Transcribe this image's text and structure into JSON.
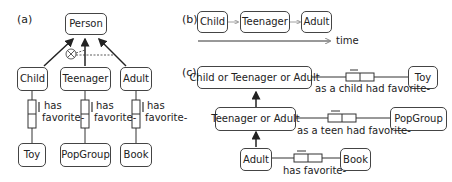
{
  "panels": {
    "a": {
      "label": "(a)",
      "supertype": "Person",
      "subtypes": [
        "Child",
        "Teenager",
        "Adult"
      ],
      "fact_label_line1": "has",
      "fact_label_line2": "favorite-",
      "targets": [
        "Toy",
        "PopGroup",
        "Book"
      ],
      "constraint": "exclusive-or"
    },
    "b": {
      "label": "(b)",
      "sequence": [
        "Child",
        "Teenager",
        "Adult"
      ],
      "axis_label": "time"
    },
    "c": {
      "label": "(c)",
      "types": [
        "Child or Teenager or Adult",
        "Teenager or Adult",
        "Adult"
      ],
      "targets": [
        "Toy",
        "PopGroup",
        "Book"
      ],
      "facts": [
        "as a child had favorite-",
        "as a teen had favorite-",
        "has favorite-"
      ]
    }
  },
  "colors": {
    "line": "#333333",
    "box_border": "#444444",
    "arrow_light": "#888888"
  }
}
